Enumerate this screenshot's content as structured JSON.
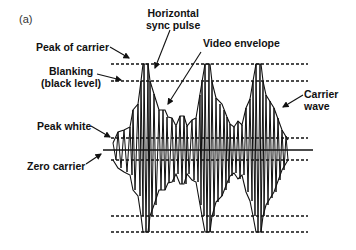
{
  "figure": {
    "panel_label": "(a)",
    "labels": {
      "horizontal_sync_pulse": [
        "Horizontal",
        "sync pulse"
      ],
      "peak_of_carrier": "Peak of  carrier",
      "video_envelope": "Video envelope",
      "blanking": [
        "Blanking",
        "(black level)"
      ],
      "carrier_wave": [
        "Carrier",
        "wave"
      ],
      "peak_white": "Peak white",
      "zero_carrier": "Zero carrier"
    },
    "colors": {
      "line": "#111111",
      "background": "#ffffff"
    }
  }
}
